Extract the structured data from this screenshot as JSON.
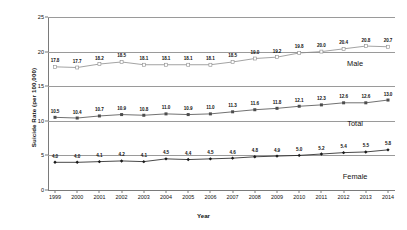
{
  "chart_data": {
    "type": "line",
    "title": "",
    "xlabel": "Year",
    "ylabel": "Suicide Rate (per 100,000)",
    "categories": [
      "1999",
      "2000",
      "2001",
      "2002",
      "2003",
      "2004",
      "2005",
      "2006",
      "2007",
      "2008",
      "2009",
      "2010",
      "2011",
      "2012",
      "2013",
      "2014"
    ],
    "ylim": [
      0,
      25
    ],
    "yticks": [
      "0",
      "5",
      "10",
      "15",
      "20",
      "25"
    ],
    "grid": true,
    "legend_position": "inline-right",
    "series": [
      {
        "name": "Male",
        "color": "#8c8c8c",
        "marker": "open-square",
        "label_x": 0.885,
        "label_y": 18.9,
        "values": [
          17.8,
          17.7,
          18.2,
          18.5,
          18.1,
          18.1,
          18.1,
          18.1,
          18.5,
          19.0,
          19.2,
          19.8,
          20.0,
          20.4,
          20.8,
          20.7
        ],
        "value_labels": [
          "17.8",
          "17.7",
          "18.2",
          "18.5",
          "18.1",
          "18.1",
          "18.1",
          "18.1",
          "18.5",
          "19.0",
          "19.2",
          "19.8",
          "20.0",
          "20.4",
          "20.8",
          "20.7"
        ]
      },
      {
        "name": "Total",
        "color": "#4d4d4d",
        "marker": "filled-square",
        "label_x": 0.885,
        "label_y": 10.2,
        "values": [
          10.5,
          10.4,
          10.7,
          10.9,
          10.8,
          11.0,
          10.9,
          11.0,
          11.3,
          11.6,
          11.8,
          12.1,
          12.3,
          12.6,
          12.6,
          13.0
        ],
        "value_labels": [
          "10.5",
          "10.4",
          "10.7",
          "10.9",
          "10.8",
          "11.0",
          "10.9",
          "11.0",
          "11.3",
          "11.6",
          "11.8",
          "12.1",
          "12.3",
          "12.6",
          "12.6",
          "13.0"
        ]
      },
      {
        "name": "Female",
        "color": "#1a1a1a",
        "marker": "filled-diamond",
        "label_x": 0.885,
        "label_y": 2.6,
        "values": [
          4.0,
          4.0,
          4.1,
          4.2,
          4.1,
          4.5,
          4.4,
          4.5,
          4.6,
          4.8,
          4.9,
          5.0,
          5.2,
          5.4,
          5.5,
          5.8
        ],
        "value_labels": [
          "4.0",
          "4.0",
          "4.1",
          "4.2",
          "4.1",
          "4.5",
          "4.4",
          "4.5",
          "4.6",
          "4.8",
          "4.9",
          "5.0",
          "5.2",
          "5.4",
          "5.5",
          "5.8"
        ]
      }
    ]
  }
}
